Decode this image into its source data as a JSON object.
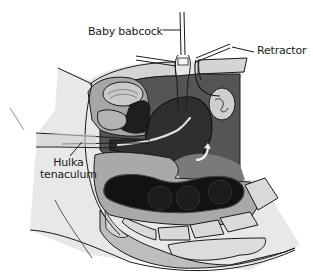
{
  "diagram": {
    "type": "anatomical-surgical-illustration",
    "style": "grayscale line drawing",
    "labels": {
      "baby_babcock": "Baby babcock",
      "retractor": "Retractor",
      "hulka_line1": "Hulka",
      "hulka_line2": "tenaculum"
    },
    "colors": {
      "background": "#ffffff",
      "outline": "#1a1a1a",
      "skin_light": "#e6e6e6",
      "tissue_mid": "#a8a8a8",
      "cavity_dark": "#5a5a5a",
      "organ_dark": "#2e2e2e",
      "bowel_black": "#141414",
      "bone_light": "#d8d8d8"
    }
  }
}
